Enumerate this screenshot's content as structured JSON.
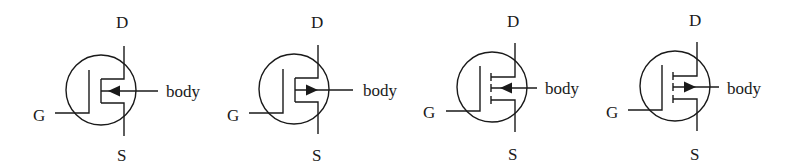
{
  "figure": {
    "symbols": [
      {
        "id": "nmos-depletion",
        "channel": "solid",
        "arrow": "inward",
        "labels": {
          "drain": "D",
          "source": "S",
          "gate": "G",
          "body": "body"
        }
      },
      {
        "id": "pmos-depletion",
        "channel": "solid",
        "arrow": "outward",
        "labels": {
          "drain": "D",
          "source": "S",
          "gate": "G",
          "body": "body"
        }
      },
      {
        "id": "nmos-enhancement",
        "channel": "broken",
        "arrow": "inward",
        "labels": {
          "drain": "D",
          "source": "S",
          "gate": "G",
          "body": "body"
        }
      },
      {
        "id": "pmos-enhancement",
        "channel": "broken",
        "arrow": "outward",
        "labels": {
          "drain": "D",
          "source": "S",
          "gate": "G",
          "body": "body"
        }
      }
    ]
  }
}
